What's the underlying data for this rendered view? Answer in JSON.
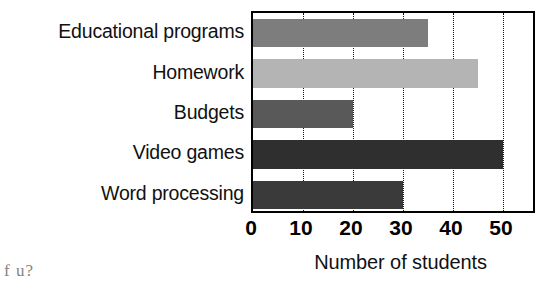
{
  "chart_data": {
    "type": "bar",
    "orientation": "horizontal",
    "title": "",
    "xlabel": "Number of students",
    "ylabel": "",
    "categories": [
      "Educational programs",
      "Homework",
      "Budgets",
      "Video games",
      "Word processing"
    ],
    "values": [
      35,
      45,
      20,
      50,
      30
    ],
    "bar_colors": [
      "#7d7d7d",
      "#b4b4b4",
      "#595959",
      "#2f2f2f",
      "#3a3a3a"
    ],
    "xlim": [
      0,
      56.8
    ],
    "ylim": [
      0,
      5
    ],
    "xticks": [
      0,
      10,
      20,
      30,
      40,
      50
    ],
    "xtick_labels": [
      "0",
      "10",
      "20",
      "30",
      "40",
      "50"
    ],
    "grid": {
      "vertical": true,
      "horizontal": false,
      "style": "dotted",
      "color": "#111111"
    },
    "legend": null,
    "plot_border": true,
    "plot_border_color": "#000000"
  },
  "axis": {
    "x_title": "Number of students"
  },
  "artifact": {
    "text": "f u?"
  }
}
